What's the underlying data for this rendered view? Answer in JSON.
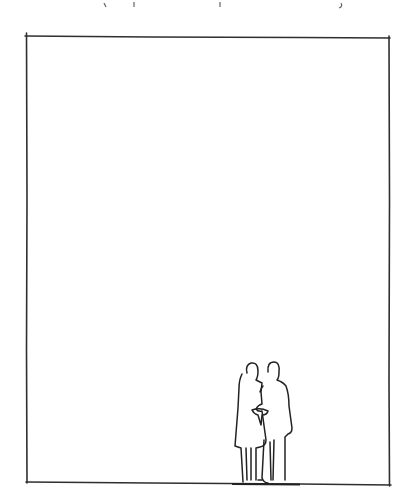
{
  "diagram": {
    "type": "architectural-scale-sketch",
    "style": "hand-drawn pen line",
    "frame": {
      "shape": "rectangle",
      "corners": {
        "top_left": [
          26,
          36
        ],
        "top_right": [
          389,
          38
        ],
        "bottom_right": [
          389,
          485
        ],
        "bottom_left": [
          27,
          482
        ]
      },
      "stroke_color": "#333333"
    },
    "figures": [
      {
        "name": "woman",
        "description": "standing figure with dress, holding man's arm",
        "position": [
          248,
          420
        ]
      },
      {
        "name": "man",
        "description": "standing figure in coat, taller",
        "position": [
          276,
          420
        ]
      }
    ],
    "ground_line": {
      "y": 484
    },
    "top_cropped_text": {
      "visible": "partial descenders only, illegible"
    }
  },
  "colors": {
    "background": "#ffffff",
    "ink": "#2a2a2a"
  }
}
